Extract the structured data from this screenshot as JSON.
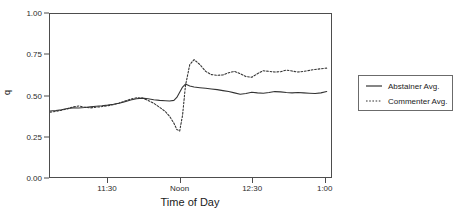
{
  "chart_data": {
    "type": "line",
    "title": "",
    "xlabel": "Time of Day",
    "ylabel": "q",
    "xlim": [
      11.1,
      13.05
    ],
    "ylim": [
      0.0,
      1.0
    ],
    "grid": false,
    "legend_position": "right",
    "y_ticks": [
      "0.00",
      "0.25",
      "0.50",
      "0.75",
      "1.00"
    ],
    "y_tick_values": [
      0.0,
      0.25,
      0.5,
      0.75,
      1.0
    ],
    "x_ticks": [
      "11:30",
      "Noon",
      "12:30",
      "1:00"
    ],
    "x_tick_values": [
      11.5,
      12.0,
      12.5,
      13.0
    ],
    "series": [
      {
        "name": "Abstainer Avg.",
        "style": "solid",
        "color": "#333333",
        "x": [
          11.1,
          11.14,
          11.18,
          11.22,
          11.26,
          11.3,
          11.34,
          11.38,
          11.42,
          11.46,
          11.5,
          11.54,
          11.58,
          11.62,
          11.66,
          11.7,
          11.74,
          11.78,
          11.82,
          11.86,
          11.9,
          11.93,
          11.96,
          11.98,
          12.0,
          12.02,
          12.04,
          12.07,
          12.1,
          12.14,
          12.18,
          12.22,
          12.26,
          12.3,
          12.34,
          12.38,
          12.42,
          12.46,
          12.5,
          12.54,
          12.58,
          12.62,
          12.66,
          12.7,
          12.74,
          12.78,
          12.82,
          12.86,
          12.9,
          12.94,
          12.98,
          13.02
        ],
        "values": [
          0.405,
          0.408,
          0.412,
          0.42,
          0.424,
          0.423,
          0.426,
          0.43,
          0.434,
          0.437,
          0.441,
          0.446,
          0.452,
          0.462,
          0.472,
          0.48,
          0.484,
          0.48,
          0.474,
          0.47,
          0.468,
          0.466,
          0.47,
          0.488,
          0.52,
          0.552,
          0.57,
          0.558,
          0.552,
          0.548,
          0.544,
          0.54,
          0.536,
          0.53,
          0.524,
          0.516,
          0.508,
          0.512,
          0.52,
          0.516,
          0.514,
          0.518,
          0.524,
          0.522,
          0.518,
          0.516,
          0.518,
          0.516,
          0.514,
          0.512,
          0.516,
          0.524
        ]
      },
      {
        "name": "Commenter Avg.",
        "style": "dotted",
        "color": "#333333",
        "x": [
          11.1,
          11.14,
          11.18,
          11.22,
          11.26,
          11.3,
          11.34,
          11.38,
          11.42,
          11.46,
          11.5,
          11.54,
          11.58,
          11.62,
          11.66,
          11.7,
          11.74,
          11.78,
          11.82,
          11.86,
          11.9,
          11.93,
          11.96,
          11.98,
          12.0,
          12.02,
          12.04,
          12.07,
          12.1,
          12.14,
          12.18,
          12.22,
          12.26,
          12.3,
          12.34,
          12.38,
          12.42,
          12.46,
          12.5,
          12.54,
          12.58,
          12.62,
          12.66,
          12.7,
          12.74,
          12.78,
          12.82,
          12.86,
          12.9,
          12.94,
          12.98,
          13.02
        ],
        "values": [
          0.398,
          0.402,
          0.41,
          0.418,
          0.43,
          0.436,
          0.428,
          0.424,
          0.428,
          0.432,
          0.437,
          0.444,
          0.454,
          0.466,
          0.478,
          0.486,
          0.484,
          0.47,
          0.452,
          0.428,
          0.402,
          0.372,
          0.33,
          0.292,
          0.282,
          0.38,
          0.56,
          0.69,
          0.72,
          0.69,
          0.648,
          0.628,
          0.624,
          0.626,
          0.64,
          0.648,
          0.634,
          0.616,
          0.612,
          0.634,
          0.652,
          0.648,
          0.644,
          0.646,
          0.656,
          0.65,
          0.644,
          0.648,
          0.654,
          0.66,
          0.664,
          0.668
        ]
      }
    ]
  },
  "legend": {
    "entries": [
      {
        "label": "Abstainer Avg."
      },
      {
        "label": "Commenter Avg."
      }
    ]
  }
}
